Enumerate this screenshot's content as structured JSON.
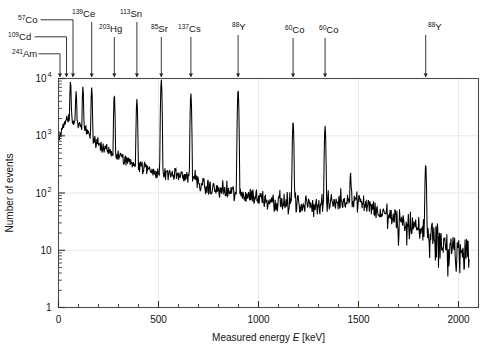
{
  "figure": {
    "kind": "gamma-ray-energy-spectrum",
    "background": "#ffffff",
    "trace_color": "#000000",
    "grid_color": "#e8e8e8",
    "frame_color": "#4d4d4d"
  },
  "axes": {
    "x": {
      "label_text": "Measured energy ",
      "label_italic": "E",
      "label_unit": " [keV]",
      "label_full": "Measured energy E [keV]",
      "min": 0,
      "max": 2100,
      "ticks": [
        0,
        500,
        1000,
        1500,
        2000
      ],
      "tick_labels": [
        "0",
        "500",
        "1000",
        "1500",
        "2000"
      ],
      "minor_tick_step": 100,
      "scale": "linear"
    },
    "y": {
      "label_full": "Number of events",
      "min": 1,
      "max": 10000,
      "scale": "log",
      "ticks": [
        1,
        10,
        100,
        1000,
        10000
      ],
      "tick_labels": [
        "1",
        "10",
        "10",
        "10",
        "10"
      ],
      "tick_exponents": [
        "",
        "",
        "2",
        "3",
        "4"
      ],
      "grid": true
    }
  },
  "annotations": [
    {
      "isotope": "Am",
      "mass": "241",
      "energy": 60,
      "label_x": 12,
      "label_y": 57,
      "leader": "elbow"
    },
    {
      "isotope": "Cd",
      "mass": "109",
      "energy": 88,
      "label_x": 8,
      "label_y": 40,
      "leader": "elbow"
    },
    {
      "isotope": "Co",
      "mass": "57",
      "energy": 122,
      "label_x": 18,
      "label_y": 23,
      "leader": "elbow"
    },
    {
      "isotope": "Ce",
      "mass": "139",
      "energy": 166,
      "label_x": 72,
      "label_y": 17,
      "leader": "straight"
    },
    {
      "isotope": "Hg",
      "mass": "203",
      "energy": 279,
      "label_x": 99,
      "label_y": 32,
      "leader": "straight"
    },
    {
      "isotope": "Sn",
      "mass": "113",
      "energy": 392,
      "label_x": 120,
      "label_y": 17,
      "leader": "straight"
    },
    {
      "isotope": "Sr",
      "mass": "85",
      "energy": 514,
      "label_x": 151,
      "label_y": 32,
      "leader": "straight"
    },
    {
      "isotope": "Cs",
      "mass": "137",
      "energy": 662,
      "label_x": 178,
      "label_y": 32,
      "leader": "straight"
    },
    {
      "isotope": "Y",
      "mass": "88",
      "energy": 898,
      "label_x": 232,
      "label_y": 30,
      "leader": "straight"
    },
    {
      "isotope": "Co",
      "mass": "60",
      "energy": 1173,
      "label_x": 285,
      "label_y": 33,
      "leader": "straight"
    },
    {
      "isotope": "Co",
      "mass": "60",
      "energy": 1333,
      "label_x": 319,
      "label_y": 33,
      "leader": "straight"
    },
    {
      "isotope": "Y",
      "mass": "88",
      "energy": 1836,
      "label_x": 428,
      "label_y": 30,
      "leader": "straight"
    }
  ],
  "chart_data": {
    "type": "line",
    "title": "",
    "xlabel": "Measured energy E [keV]",
    "ylabel": "Number of events",
    "xlim": [
      0,
      2100
    ],
    "ylim": [
      1,
      10000
    ],
    "yscale": "log",
    "grid": true,
    "legend": null,
    "series": [
      {
        "name": "measured spectrum",
        "color": "#000000",
        "continuum_x": [
          5,
          20,
          40,
          55,
          70,
          90,
          110,
          130,
          160,
          200,
          240,
          280,
          320,
          360,
          400,
          440,
          480,
          520,
          560,
          600,
          640,
          680,
          720,
          760,
          800,
          840,
          880,
          920,
          960,
          1000,
          1040,
          1080,
          1120,
          1160,
          1200,
          1240,
          1280,
          1320,
          1360,
          1400,
          1440,
          1480,
          1520,
          1560,
          1600,
          1640,
          1680,
          1720,
          1760,
          1800,
          1840,
          1880,
          1920,
          1960,
          2000,
          2050
        ],
        "continuum_y": [
          900,
          1500,
          1900,
          2100,
          1950,
          1750,
          1500,
          1250,
          950,
          700,
          560,
          470,
          400,
          350,
          300,
          265,
          240,
          225,
          215,
          205,
          195,
          185,
          130,
          120,
          112,
          105,
          100,
          95,
          90,
          84,
          78,
          72,
          68,
          65,
          63,
          62,
          62,
          63,
          66,
          70,
          74,
          76,
          72,
          60,
          46,
          40,
          34,
          30,
          27,
          24,
          22,
          20,
          13,
          11,
          10,
          9
        ],
        "peaks": [
          {
            "energy": 60,
            "height": 9000,
            "isotope": "241Am"
          },
          {
            "energy": 88,
            "height": 6000,
            "isotope": "109Cd"
          },
          {
            "energy": 122,
            "height": 7200,
            "isotope": "57Co"
          },
          {
            "energy": 136,
            "height": 1600,
            "isotope": "57Co-satellite"
          },
          {
            "energy": 166,
            "height": 7000,
            "isotope": "139Ce"
          },
          {
            "energy": 279,
            "height": 5200,
            "isotope": "203Hg"
          },
          {
            "energy": 392,
            "height": 4400,
            "isotope": "113Sn"
          },
          {
            "energy": 514,
            "height": 9500,
            "isotope": "85Sr"
          },
          {
            "energy": 662,
            "height": 5500,
            "isotope": "137Cs"
          },
          {
            "energy": 898,
            "height": 6400,
            "isotope": "88Y"
          },
          {
            "energy": 1173,
            "height": 1800,
            "isotope": "60Co"
          },
          {
            "energy": 1333,
            "height": 1500,
            "isotope": "60Co"
          },
          {
            "energy": 1460,
            "height": 230,
            "isotope": "40K-background"
          },
          {
            "energy": 1836,
            "height": 320,
            "isotope": "88Y"
          }
        ],
        "notes": "log-scale continuum falling from ~2000 counts near 60 keV to ~10 counts near 2000 keV, with a broad bump near 1450-1600 keV and strong statistical noise above 1600 keV"
      }
    ]
  }
}
